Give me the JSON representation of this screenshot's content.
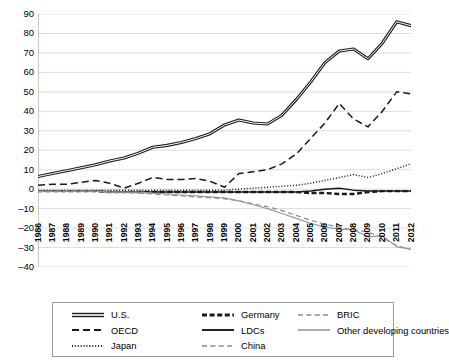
{
  "chart_data": {
    "type": "line",
    "title": "",
    "xlabel": "",
    "ylabel": "",
    "ylim": [
      -40,
      90
    ],
    "ytick_step": 10,
    "grid": true,
    "legend_position": "bottom",
    "y_ticks": [
      "90",
      "80",
      "70",
      "60",
      "50",
      "40",
      "30",
      "20",
      "10",
      "0",
      "-10",
      "-20",
      "-30",
      "-40"
    ],
    "categories": [
      "1986",
      "1987",
      "1988",
      "1989",
      "1990",
      "1991",
      "1992",
      "1993",
      "1994",
      "1995",
      "1996",
      "1997",
      "1998",
      "1999",
      "2000",
      "2001",
      "2002",
      "2003",
      "2004",
      "2005",
      "2006",
      "2007",
      "2008",
      "2009",
      "2010",
      "2011",
      "2012"
    ],
    "series": [
      {
        "name": "U.S.",
        "style": "double-solid",
        "color": "#1a1a1a",
        "values": [
          6.5,
          8.0,
          9.5,
          11.0,
          12.5,
          14.5,
          16.0,
          18.5,
          21.5,
          22.5,
          24.0,
          26.0,
          28.5,
          33.0,
          35.5,
          34.0,
          33.5,
          38.0,
          46.0,
          55.0,
          65.0,
          71.0,
          72.0,
          67.0,
          75.0,
          86.0,
          84.0
        ]
      },
      {
        "name": "OECD",
        "style": "dashed",
        "color": "#1a1a1a",
        "values": [
          2.0,
          2.5,
          2.5,
          3.5,
          4.5,
          3.0,
          0.5,
          3.0,
          6.0,
          5.0,
          5.0,
          5.5,
          4.0,
          1.0,
          8.0,
          9.0,
          10.0,
          13.0,
          18.0,
          26.0,
          34.0,
          44.0,
          36.0,
          32.0,
          40.0,
          50.0,
          49.0
        ]
      },
      {
        "name": "Japan",
        "style": "dotted",
        "color": "#1a1a1a",
        "values": [
          -0.5,
          -0.5,
          -0.5,
          -0.5,
          -0.5,
          -0.5,
          -0.5,
          -0.5,
          -0.5,
          -0.5,
          -0.5,
          -0.5,
          -0.5,
          -0.5,
          0.0,
          0.5,
          1.0,
          1.5,
          2.0,
          3.0,
          4.5,
          6.0,
          7.5,
          6.0,
          8.0,
          10.5,
          13.0
        ]
      },
      {
        "name": "Germany",
        "style": "thick-dashed",
        "color": "#1a1a1a",
        "values": [
          -1.0,
          -1.0,
          -1.0,
          -1.0,
          -1.0,
          -1.5,
          -1.5,
          -1.5,
          -1.5,
          -1.5,
          -1.5,
          -1.5,
          -1.5,
          -1.5,
          -1.5,
          -1.5,
          -1.5,
          -1.5,
          -1.5,
          -2.0,
          -2.0,
          -2.5,
          -2.5,
          -1.5,
          -1.0,
          -1.0,
          -1.0
        ]
      },
      {
        "name": "LDCs",
        "style": "solid",
        "color": "#1a1a1a",
        "values": [
          -1.0,
          -1.0,
          -1.0,
          -1.0,
          -1.0,
          -1.5,
          -1.5,
          -1.5,
          -1.5,
          -1.5,
          -1.5,
          -1.5,
          -1.5,
          -1.5,
          -1.5,
          -1.5,
          -1.5,
          -1.5,
          -1.5,
          -1.0,
          0.0,
          0.5,
          -0.5,
          -1.0,
          -1.0,
          -1.0,
          -1.0
        ]
      },
      {
        "name": "BRIC",
        "style": "light-dashed",
        "color": "#8c8c8c",
        "values": [
          -1.0,
          -1.0,
          -1.0,
          -1.0,
          -1.0,
          -1.5,
          -1.5,
          -2.0,
          -2.5,
          -3.0,
          -3.5,
          -4.0,
          -4.5,
          -5.0,
          -6.0,
          -7.5,
          -9.0,
          -11.0,
          -13.5,
          -16.0,
          -18.0,
          -19.5,
          -21.0,
          -22.0,
          -25.0,
          -29.0,
          -31.0
        ]
      },
      {
        "name": "Other developing countries",
        "style": "light-solid",
        "color": "#9a9a9a",
        "values": [
          -1.0,
          -1.0,
          -1.0,
          -1.0,
          -1.0,
          -1.5,
          -1.5,
          -1.5,
          -2.0,
          -2.5,
          -3.0,
          -3.5,
          -4.0,
          -4.5,
          -6.0,
          -8.0,
          -10.0,
          -12.5,
          -15.0,
          -17.5,
          -19.5,
          -20.5,
          -21.0,
          -24.5,
          -24.0,
          -29.5,
          -31.0
        ]
      }
    ]
  },
  "legend": {
    "columns": [
      {
        "items": [
          {
            "label": "U.S.",
            "style": "double-solid",
            "color": "#1a1a1a"
          },
          {
            "label": "OECD",
            "style": "dashed",
            "color": "#1a1a1a"
          },
          {
            "label": "Japan",
            "style": "dotted",
            "color": "#1a1a1a"
          }
        ]
      },
      {
        "items": [
          {
            "label": "Germany",
            "style": "thick-dashed",
            "color": "#1a1a1a"
          },
          {
            "label": "LDCs",
            "style": "solid",
            "color": "#1a1a1a"
          },
          {
            "label": "China",
            "style": "light-dashed",
            "color": "#8c8c8c"
          }
        ]
      },
      {
        "items": [
          {
            "label": "BRIC",
            "style": "light-dashed",
            "color": "#8c8c8c"
          },
          {
            "label": "Other developing countries",
            "style": "light-solid",
            "color": "#9a9a9a"
          }
        ]
      }
    ]
  }
}
